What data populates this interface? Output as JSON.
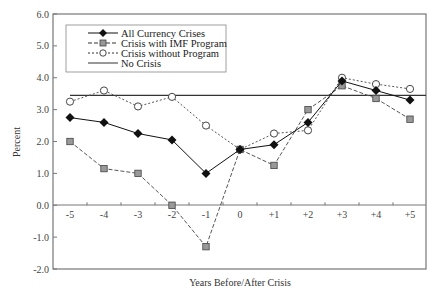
{
  "chart_data": {
    "type": "line",
    "title": "",
    "xlabel": "Years Before/After Crisis",
    "ylabel": "Percent",
    "x": [
      "-5",
      "-4",
      "-3",
      "-2",
      "-1",
      "0",
      "+1",
      "+2",
      "+3",
      "+4",
      "+5"
    ],
    "ylim": [
      -2.0,
      6.0
    ],
    "yticks": [
      "6.0",
      "5.0",
      "4.0",
      "3.0",
      "2.0",
      "1.0",
      "0.0",
      "-1.0",
      "-2.0"
    ],
    "grid": false,
    "legend_position": "upper-left",
    "series": [
      {
        "name": "All Currency Crises",
        "marker": "diamond-filled",
        "line": "solid",
        "color": "#111111",
        "values": [
          2.75,
          2.6,
          2.25,
          2.05,
          1.0,
          1.75,
          1.9,
          2.6,
          3.9,
          3.6,
          3.3
        ]
      },
      {
        "name": "Crisis with IMF Program",
        "marker": "square-gray",
        "line": "dashed",
        "color": "#555555",
        "values": [
          2.0,
          1.15,
          1.0,
          0.0,
          -1.3,
          1.75,
          1.25,
          3.0,
          3.75,
          3.35,
          2.7
        ]
      },
      {
        "name": "Crisis without Program",
        "marker": "circle-open",
        "line": "dotted",
        "color": "#555555",
        "values": [
          3.25,
          3.6,
          3.1,
          3.4,
          2.5,
          1.75,
          2.25,
          2.35,
          4.0,
          3.8,
          3.65
        ]
      },
      {
        "name": "No Crisis",
        "marker": "none",
        "line": "solid",
        "color": "#333333",
        "values": [
          3.45,
          3.45,
          3.45,
          3.45,
          3.45,
          3.45,
          3.45,
          3.45,
          3.45,
          3.45,
          3.45
        ]
      }
    ]
  },
  "labels": {
    "xlabel": "Years Before/After Crisis",
    "ylabel": "Percent",
    "legend": [
      "All Currency Crises",
      "Crisis with IMF Program",
      "Crisis without Program",
      "No Crisis"
    ]
  }
}
